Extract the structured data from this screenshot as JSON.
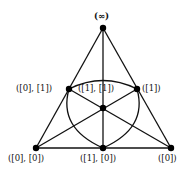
{
  "diagram": {
    "type": "fano-plane",
    "nodes": [
      {
        "id": "inf",
        "label": "(∞)",
        "x": 103,
        "y": 28
      },
      {
        "id": "n01",
        "label": "([0], [1])",
        "x": 69,
        "y": 89
      },
      {
        "id": "n11",
        "label": "([1], [1])",
        "x": 103,
        "y": 108
      },
      {
        "id": "n1",
        "label": "([1])",
        "x": 137,
        "y": 89
      },
      {
        "id": "n00",
        "label": "([0], [0])",
        "x": 36,
        "y": 148
      },
      {
        "id": "n10",
        "label": "([1], [0])",
        "x": 103,
        "y": 148
      },
      {
        "id": "n0",
        "label": "([0])",
        "x": 171,
        "y": 148
      }
    ],
    "lines": [
      [
        "inf",
        "n01",
        "n00"
      ],
      [
        "inf",
        "n1",
        "n0"
      ],
      [
        "inf",
        "n11",
        "n10"
      ],
      [
        "n00",
        "n10",
        "n0"
      ],
      [
        "n00",
        "n11",
        "n1"
      ],
      [
        "n0",
        "n11",
        "n01"
      ],
      [
        "n01",
        "n1",
        "n10"
      ]
    ],
    "colors": {
      "line": "#111111",
      "node": "#000000",
      "background": "#ffffff"
    }
  },
  "labels": {
    "inf": "(∞)",
    "n01": "([0], [1])",
    "n11": "([1], [1])",
    "n1": "([1])",
    "n00": "([0], [0])",
    "n10": "([1], [0])",
    "n0": "([0])"
  }
}
